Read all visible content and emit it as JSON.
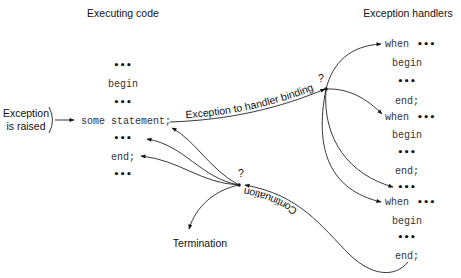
{
  "headings": {
    "executing_code": "Executing code",
    "exception_handlers": "Exception handlers"
  },
  "exception_label": [
    "Exception",
    "is raised"
  ],
  "executing_code_lines": [
    "•••",
    "begin",
    "•••",
    "some statement;",
    "•••",
    "end;",
    "•••"
  ],
  "handler_lines": [
    {
      "kind": "when",
      "text": "when",
      "dots": "•••"
    },
    {
      "kind": "code",
      "text": "begin"
    },
    {
      "kind": "dots",
      "text": "•••"
    },
    {
      "kind": "code",
      "text": "end;"
    },
    {
      "kind": "when",
      "text": "when",
      "dots": "•••"
    },
    {
      "kind": "code",
      "text": "begin"
    },
    {
      "kind": "dots",
      "text": "•••"
    },
    {
      "kind": "code",
      "text": "end;"
    },
    {
      "kind": "dots",
      "text": "•••"
    },
    {
      "kind": "when",
      "text": "when",
      "dots": "•••"
    },
    {
      "kind": "code",
      "text": "begin"
    },
    {
      "kind": "dots",
      "text": "•••"
    },
    {
      "kind": "code",
      "text": "end;"
    }
  ],
  "edge_labels": {
    "binding": "Exception to handler binding",
    "continuation": "Continuation",
    "termination": "Termination"
  },
  "decision_marks": {
    "binding_question": "?",
    "continuation_question": "?"
  }
}
